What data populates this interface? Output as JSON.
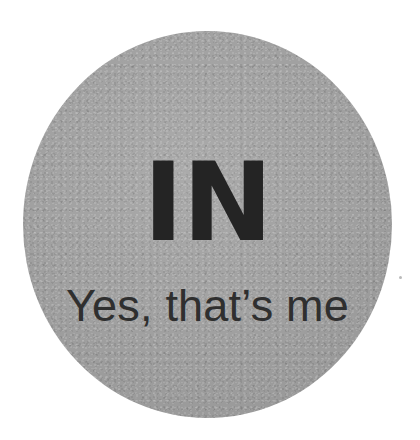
{
  "canvas": {
    "width": 420,
    "height": 440,
    "background_color": "#ffffff"
  },
  "badge": {
    "shape": "circle",
    "fill_color": "#a1a1a1",
    "bounds": {
      "left": 23,
      "top": 31,
      "width": 369,
      "height": 387
    },
    "headline": "IN",
    "headline_color": "#242424",
    "subline": "Yes, that’s me",
    "subline_color": "#2f2f2f"
  },
  "artifacts": {
    "speck_label": ""
  }
}
